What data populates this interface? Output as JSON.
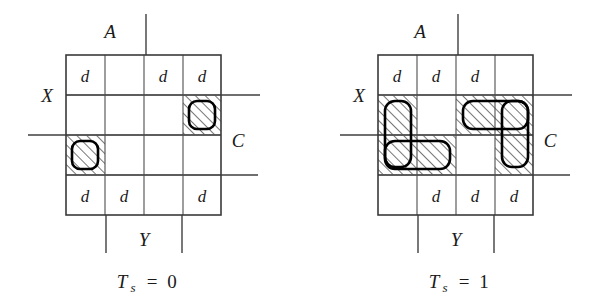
{
  "figure": {
    "background_color": "#ffffff",
    "line_color": "#3f3f3f",
    "hatch_color": "#555555",
    "loop_color": "#000000",
    "dont_care_symbol": "d"
  },
  "maps": [
    {
      "id": "kmap-ts0",
      "caption": {
        "variable": "T",
        "subscript": "s",
        "equals": "=",
        "value": "0",
        "full": "Ts = 0"
      },
      "axis_labels": {
        "top": "A",
        "left": "X",
        "right": "C",
        "bottom": "Y"
      },
      "grid": {
        "rows": 4,
        "cols": 4,
        "x": 66,
        "y": 55,
        "cell_w": 39,
        "cell_h": 40
      },
      "dont_care_cells": [
        {
          "row": 0,
          "col": 0,
          "label": "d"
        },
        {
          "row": 0,
          "col": 2,
          "label": "d"
        },
        {
          "row": 0,
          "col": 3,
          "label": "d"
        },
        {
          "row": 3,
          "col": 0,
          "label": "d"
        },
        {
          "row": 3,
          "col": 1,
          "label": "d"
        },
        {
          "row": 3,
          "col": 3,
          "label": "d"
        }
      ],
      "hatched_cells": [
        {
          "row": 1,
          "col": 3
        },
        {
          "row": 2,
          "col": 0
        }
      ],
      "loops": [
        {
          "row": 1,
          "col": 3,
          "row_span": 1,
          "col_span": 1
        },
        {
          "row": 2,
          "col": 0,
          "row_span": 1,
          "col_span": 1
        }
      ]
    },
    {
      "id": "kmap-ts1",
      "caption": {
        "variable": "T",
        "subscript": "s",
        "equals": "=",
        "value": "1",
        "full": "Ts = 1"
      },
      "axis_labels": {
        "top": "A",
        "left": "X",
        "right": "C",
        "bottom": "Y"
      },
      "grid": {
        "rows": 4,
        "cols": 4,
        "x": 378,
        "y": 55,
        "cell_w": 39,
        "cell_h": 40
      },
      "dont_care_cells": [
        {
          "row": 0,
          "col": 0,
          "label": "d"
        },
        {
          "row": 0,
          "col": 1,
          "label": "d"
        },
        {
          "row": 0,
          "col": 2,
          "label": "d"
        },
        {
          "row": 3,
          "col": 1,
          "label": "d"
        },
        {
          "row": 3,
          "col": 2,
          "label": "d"
        },
        {
          "row": 3,
          "col": 3,
          "label": "d"
        }
      ],
      "hatched_cells": [
        {
          "row": 1,
          "col": 0
        },
        {
          "row": 1,
          "col": 2
        },
        {
          "row": 1,
          "col": 3
        },
        {
          "row": 2,
          "col": 0
        },
        {
          "row": 2,
          "col": 1
        },
        {
          "row": 2,
          "col": 3
        }
      ],
      "loops": [
        {
          "row": 1,
          "col": 0,
          "row_span": 2,
          "col_span": 1
        },
        {
          "row": 2,
          "col": 0,
          "row_span": 1,
          "col_span": 2
        },
        {
          "row": 1,
          "col": 2,
          "row_span": 1,
          "col_span": 2
        },
        {
          "row": 1,
          "col": 3,
          "row_span": 2,
          "col_span": 1
        }
      ]
    }
  ]
}
